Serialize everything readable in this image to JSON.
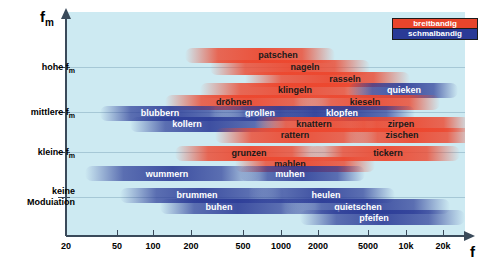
{
  "chart_data": {
    "type": "scatter",
    "title": "",
    "xlabel": "f",
    "ylabel": "f_m",
    "grid": true,
    "legend_position": "top-right",
    "x_axis": {
      "scale": "log",
      "ticks": [
        {
          "label": "20",
          "value": 20,
          "px": 66
        },
        {
          "label": "50",
          "value": 50,
          "px": 117
        },
        {
          "label": "100",
          "value": 100,
          "px": 153
        },
        {
          "label": "200",
          "value": 200,
          "px": 191
        },
        {
          "label": "500",
          "value": 500,
          "px": 243
        },
        {
          "label": "1000",
          "value": 1000,
          "px": 281
        },
        {
          "label": "2000",
          "value": 2000,
          "px": 318
        },
        {
          "label": "5000",
          "value": 5000,
          "px": 368
        },
        {
          "label": "10k",
          "value": 10000,
          "px": 406
        },
        {
          "label": "20k",
          "value": 20000,
          "px": 443
        }
      ]
    },
    "y_axis": {
      "ticks": [
        {
          "label": "hohe f",
          "sub": "m",
          "px": 67
        },
        {
          "label": "mittlere f",
          "sub": "m",
          "px": 112
        },
        {
          "label": "kleine f",
          "sub": "m",
          "px": 152
        },
        {
          "label": "keine",
          "label2": "Moduiation",
          "sub": "",
          "px": 197
        }
      ]
    },
    "series": [
      {
        "name": "breitbandig",
        "color": "#e8452c"
      },
      {
        "name": "schmalbandig",
        "color": "#2a3a96"
      }
    ],
    "bands": [
      {
        "label": "patschen",
        "type": "wide",
        "left": 185,
        "width": 150,
        "top": 48,
        "label_x": 278,
        "label_y": 55
      },
      {
        "label": "nageln",
        "type": "wide",
        "left": 210,
        "width": 160,
        "top": 60,
        "label_x": 305,
        "label_y": 67
      },
      {
        "label": "rasseln",
        "type": "wide",
        "left": 245,
        "width": 165,
        "top": 72,
        "label_x": 345,
        "label_y": 79
      },
      {
        "label": "klingeln",
        "type": "wide",
        "left": 200,
        "width": 185,
        "top": 83,
        "label_x": 295,
        "label_y": 90
      },
      {
        "label": "quieken",
        "type": "narrow",
        "left": 348,
        "width": 110,
        "top": 83,
        "label_x": 404,
        "label_y": 90
      },
      {
        "label": "dröhnen",
        "type": "wide",
        "left": 165,
        "width": 165,
        "top": 95,
        "label_x": 234,
        "label_y": 102
      },
      {
        "label": "kieseln",
        "type": "wide",
        "left": 300,
        "width": 140,
        "top": 95,
        "label_x": 365,
        "label_y": 102
      },
      {
        "label": "blubbern",
        "type": "narrow",
        "left": 100,
        "width": 140,
        "top": 106,
        "label_x": 160,
        "label_y": 113
      },
      {
        "label": "grollen",
        "type": "narrow",
        "left": 215,
        "width": 130,
        "top": 106,
        "label_x": 260,
        "label_y": 113
      },
      {
        "label": "klopfen",
        "type": "narrow",
        "left": 285,
        "width": 130,
        "top": 106,
        "label_x": 342,
        "label_y": 113
      },
      {
        "label": "kollern",
        "type": "narrow",
        "left": 130,
        "width": 160,
        "top": 117,
        "label_x": 187,
        "label_y": 124
      },
      {
        "label": "knattern",
        "type": "wide",
        "left": 255,
        "width": 140,
        "top": 117,
        "label_x": 314,
        "label_y": 124
      },
      {
        "label": "zirpen",
        "type": "wide",
        "left": 350,
        "width": 120,
        "top": 117,
        "label_x": 401,
        "label_y": 124
      },
      {
        "label": "rattern",
        "type": "wide",
        "left": 215,
        "width": 165,
        "top": 128,
        "label_x": 295,
        "label_y": 135
      },
      {
        "label": "zischen",
        "type": "wide",
        "left": 350,
        "width": 125,
        "top": 128,
        "label_x": 402,
        "label_y": 135
      },
      {
        "label": "grunzen",
        "type": "wide",
        "left": 175,
        "width": 150,
        "top": 146,
        "label_x": 249,
        "label_y": 153
      },
      {
        "label": "tickern",
        "type": "wide",
        "left": 310,
        "width": 150,
        "top": 146,
        "label_x": 388,
        "label_y": 153
      },
      {
        "label": "mahlen",
        "type": "wide",
        "left": 235,
        "width": 140,
        "top": 157,
        "label_x": 290,
        "label_y": 164
      },
      {
        "label": "wummern",
        "type": "narrow",
        "left": 85,
        "width": 175,
        "top": 166,
        "label_x": 167,
        "label_y": 174
      },
      {
        "label": "muhen",
        "type": "narrow",
        "left": 240,
        "width": 125,
        "top": 166,
        "label_x": 290,
        "label_y": 174
      },
      {
        "label": "brummen",
        "type": "narrow",
        "left": 120,
        "width": 165,
        "top": 188,
        "label_x": 197,
        "label_y": 195
      },
      {
        "label": "heulen",
        "type": "narrow",
        "left": 250,
        "width": 145,
        "top": 188,
        "label_x": 326,
        "label_y": 195
      },
      {
        "label": "buhen",
        "type": "narrow",
        "left": 160,
        "width": 155,
        "top": 199,
        "label_x": 219,
        "label_y": 207
      },
      {
        "label": "quietschen",
        "type": "narrow",
        "left": 285,
        "width": 165,
        "top": 199,
        "label_x": 358,
        "label_y": 207
      },
      {
        "label": "pfeifen",
        "type": "narrow",
        "left": 300,
        "width": 165,
        "top": 210,
        "label_x": 374,
        "label_y": 218
      }
    ]
  },
  "legend": {
    "wide_label": "breitbandig",
    "narrow_label": "schmalbandig"
  },
  "axis_titles": {
    "y": "f",
    "y_sub": "m",
    "x": "f"
  }
}
